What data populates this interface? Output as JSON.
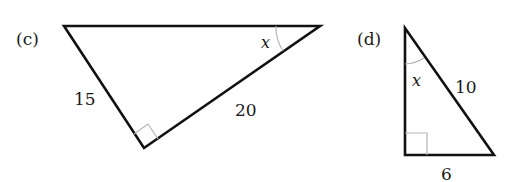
{
  "figures": [
    {
      "id": "c",
      "label": "(c)",
      "vertices": {
        "top_left": [
          64,
          26
        ],
        "top_right": [
          320,
          26
        ],
        "bottom_right_angle": [
          144,
          148
        ]
      },
      "side_labels": {
        "left_leg": "15",
        "right_leg": "20"
      },
      "angle_label": "x",
      "angle_at": "top_right",
      "right_angle_at": "bottom"
    },
    {
      "id": "d",
      "label": "(d)",
      "vertices": {
        "top": [
          405,
          28
        ],
        "bottom_left_right_angle": [
          405,
          155
        ],
        "bottom_right": [
          494,
          155
        ]
      },
      "side_labels": {
        "hypotenuse": "10",
        "bottom_leg": "6"
      },
      "angle_label": "x",
      "angle_at": "top",
      "right_angle_at": "bottom_left"
    }
  ],
  "colors": {
    "edge": "#111111",
    "mark": "#b5b5b5",
    "text": "#1a1a1a",
    "background": "#ffffff"
  }
}
